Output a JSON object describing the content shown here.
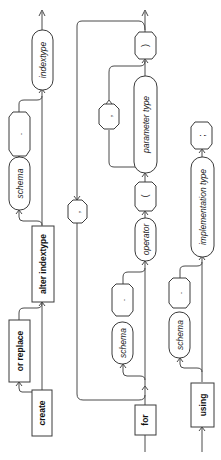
{
  "diagram": {
    "type": "railroad-syntax-diagram",
    "orientation": "rotated-90-ccw",
    "colors": {
      "line": "#4a4a4a",
      "box_border": "#3a3a3a",
      "background": "#ffffff",
      "text": "#111111"
    },
    "rows": [
      {
        "id": "row1",
        "items": [
          {
            "kind": "keyword",
            "label": "create"
          },
          {
            "kind": "keyword",
            "label": "or replace",
            "optional": true
          },
          {
            "kind": "keyword",
            "label": "alter indextype"
          },
          {
            "kind": "identifier",
            "label": "schema",
            "optional_group": "schema-prefix"
          },
          {
            "kind": "punct",
            "label": ".",
            "optional_group": "schema-prefix"
          },
          {
            "kind": "identifier",
            "label": "indextype"
          }
        ]
      },
      {
        "id": "row2",
        "items": [
          {
            "kind": "keyword",
            "label": "for"
          },
          {
            "kind": "identifier",
            "label": "schema",
            "optional_group": "schema-prefix"
          },
          {
            "kind": "punct",
            "label": ".",
            "optional_group": "schema-prefix"
          },
          {
            "kind": "identifier",
            "label": "operator"
          },
          {
            "kind": "punct",
            "label": "("
          },
          {
            "kind": "identifier",
            "label": "parameter type"
          },
          {
            "kind": "punct",
            "label": ",",
            "loop_separator": true
          },
          {
            "kind": "punct",
            "label": ")"
          },
          {
            "kind": "punct",
            "label": ",",
            "loop_separator": true,
            "note": "outer repeat"
          }
        ]
      },
      {
        "id": "row3",
        "items": [
          {
            "kind": "keyword",
            "label": "using"
          },
          {
            "kind": "identifier",
            "label": "schema",
            "optional_group": "schema-prefix"
          },
          {
            "kind": "punct",
            "label": ".",
            "optional_group": "schema-prefix"
          },
          {
            "kind": "identifier",
            "label": "implementation type"
          },
          {
            "kind": "punct",
            "label": ";"
          }
        ]
      }
    ],
    "labels": {
      "create": "create",
      "or_replace": "or replace",
      "alter_indextype": "alter indextype",
      "schema1": "schema",
      "dot1": ".",
      "indextype": "indextype",
      "for": "for",
      "schema2": "schema",
      "dot2": ".",
      "operator": "operator",
      "lparen": "(",
      "parameter_type": "parameter type",
      "comma_inner": ",",
      "rparen": ")",
      "comma_outer": ",",
      "using": "using",
      "schema3": "schema",
      "dot3": ".",
      "implementation_type": "implementation type",
      "semicolon": ";"
    }
  }
}
